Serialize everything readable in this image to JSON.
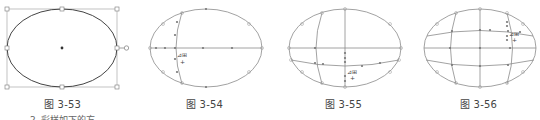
{
  "figures": [
    {
      "id": "fig-3-53",
      "caption": "图 3-53",
      "description": "ellipse selected with bounding box handles"
    },
    {
      "id": "fig-3-54",
      "caption": "图 3-54",
      "description": "ellipse with first mesh point added"
    },
    {
      "id": "fig-3-55",
      "caption": "图 3-55",
      "description": "ellipse with second mesh point added"
    },
    {
      "id": "fig-3-56",
      "caption": "图 3-56",
      "description": "ellipse with multiple mesh lines"
    }
  ],
  "footer_partial_text": "2. 彩样如下的方",
  "colors": {
    "stroke": "#8a8a8a",
    "outline": "#555555",
    "caption": "#444444"
  }
}
